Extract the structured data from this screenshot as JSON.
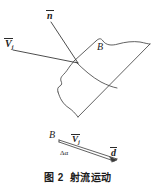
{
  "figure": {
    "caption_label": "图 2",
    "caption_title": "射流运动",
    "labels": {
      "normal_vector": "n",
      "jet_velocity_main": "V",
      "jet_velocity_main_sub": "j",
      "surface_b_top": "B",
      "surface_b_bottom": "B",
      "jet_velocity_detail": "V",
      "jet_velocity_detail_sub": "j",
      "delta_alpha": "Δα",
      "distance_d": "d"
    },
    "colors": {
      "line": "#3a3a3a",
      "text": "#1b1b1b",
      "background": "#ffffff"
    }
  }
}
